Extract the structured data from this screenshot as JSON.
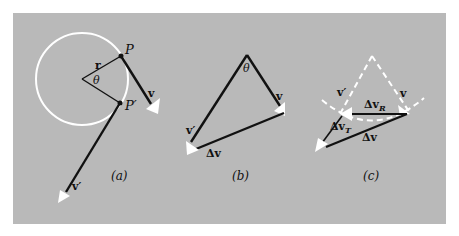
{
  "figure": {
    "background_color": "#b9b9b9",
    "line_color": "#111111",
    "highlight_color": "#ffffff",
    "panels": [
      {
        "id": "a",
        "caption": "(a)",
        "labels": {
          "P": "P",
          "P_prime": "P′",
          "r": "r",
          "theta": "θ",
          "v": "v",
          "v_prime": "v′"
        }
      },
      {
        "id": "b",
        "caption": "(b)",
        "labels": {
          "theta": "θ",
          "v": "v",
          "v_prime": "v′",
          "delta_v": "Δv"
        }
      },
      {
        "id": "c",
        "caption": "(c)",
        "labels": {
          "v": "v",
          "v_prime": "v′",
          "delta_v_R": "Δv",
          "delta_v_R_sub": "R",
          "delta_v_T": "Δv",
          "delta_v_T_sub": "T",
          "delta_v": "Δv"
        }
      }
    ]
  }
}
